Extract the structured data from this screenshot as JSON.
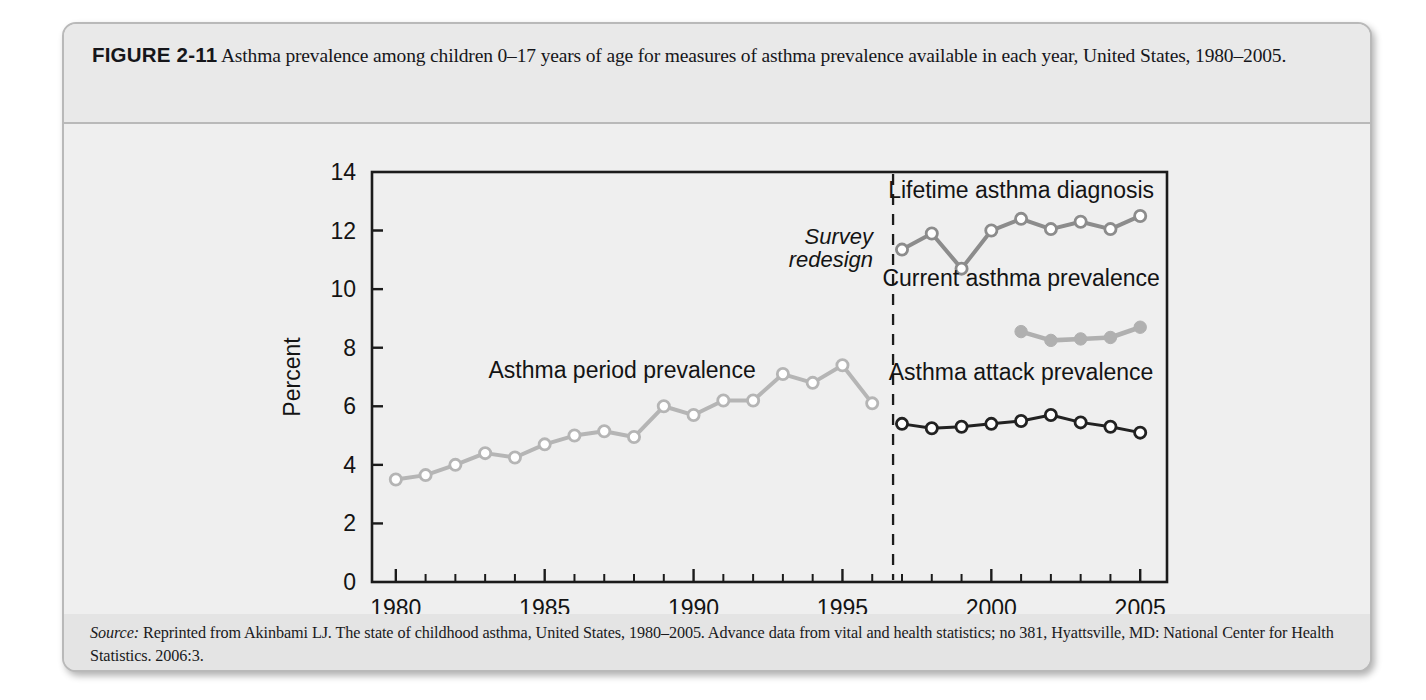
{
  "figure": {
    "label": "FIGURE 2-11",
    "caption": "Asthma prevalence among children 0–17 years of age for measures of asthma prevalence available in each year, United States, 1980–2005."
  },
  "source": {
    "word": "Source:",
    "text": " Reprinted from Akinbami LJ. The state of childhood asthma, United States, 1980–2005. Advance data from vital and health statistics; no 381, Hyattsville, MD: National Center for Health Statistics. 2006:3."
  },
  "annotations": {
    "survey_redesign_line1": "Survey",
    "survey_redesign_line2": "redesign",
    "redesign_year": 1996.7
  },
  "colors": {
    "period_prevalence": "#b5b5b5",
    "lifetime_diagnosis": "#8c8c8c",
    "current_prevalence": "#b0b0b0",
    "attack_prevalence": "#222222",
    "axis": "#1b1b1b",
    "card_bg": "#ececec",
    "plot_bg": "#efefef"
  },
  "chart_data": {
    "type": "line",
    "title": "",
    "xlabel": "",
    "ylabel": "Percent",
    "xlim": [
      1979.2,
      2005.9
    ],
    "ylim": [
      0,
      14
    ],
    "yticks": [
      0,
      2,
      4,
      6,
      8,
      10,
      12,
      14
    ],
    "ytick_labels": [
      "0",
      "2",
      "4",
      "6",
      "8",
      "10",
      "12",
      "14"
    ],
    "xticks_major": [
      1980,
      1985,
      1990,
      1995,
      2000,
      2005
    ],
    "xtick_labels": [
      "1980",
      "1985",
      "1990",
      "1995",
      "2000",
      "2005"
    ],
    "xticks_minor": [
      1981,
      1982,
      1983,
      1984,
      1986,
      1987,
      1988,
      1989,
      1991,
      1992,
      1993,
      1994,
      1996,
      1997,
      1998,
      1999,
      2001,
      2002,
      2003,
      2004
    ],
    "grid": false,
    "legend_position": "in-plot-annotations",
    "series": [
      {
        "name": "Asthma period prevalence",
        "marker": "open-circle",
        "color": "#b5b5b5",
        "label_x": 1987.6,
        "label_y": 6.95,
        "x": [
          1980,
          1981,
          1982,
          1983,
          1984,
          1985,
          1986,
          1987,
          1988,
          1989,
          1990,
          1991,
          1992,
          1993,
          1994,
          1995,
          1996
        ],
        "values": [
          3.5,
          3.65,
          4.0,
          4.4,
          4.25,
          4.7,
          5.0,
          5.15,
          4.95,
          6.0,
          5.7,
          6.2,
          6.2,
          7.1,
          6.8,
          7.4,
          6.1
        ]
      },
      {
        "name": "Lifetime asthma diagnosis",
        "marker": "open-circle",
        "color": "#8c8c8c",
        "label_x": 2001.0,
        "label_y": 13.1,
        "x": [
          1997,
          1998,
          1999,
          2000,
          2001,
          2002,
          2003,
          2004,
          2005
        ],
        "values": [
          11.35,
          11.9,
          10.7,
          12.0,
          12.4,
          12.05,
          12.3,
          12.05,
          12.5
        ]
      },
      {
        "name": "Current asthma prevalence",
        "marker": "filled-circle",
        "color": "#b0b0b0",
        "label_x": 2001.0,
        "label_y": 10.1,
        "x": [
          2001,
          2002,
          2003,
          2004,
          2005
        ],
        "values": [
          8.55,
          8.25,
          8.3,
          8.35,
          8.7
        ]
      },
      {
        "name": "Asthma attack prevalence",
        "marker": "open-circle",
        "color": "#222222",
        "label_x": 2001.0,
        "label_y": 6.9,
        "x": [
          1997,
          1998,
          1999,
          2000,
          2001,
          2002,
          2003,
          2004,
          2005
        ],
        "values": [
          5.4,
          5.25,
          5.3,
          5.4,
          5.5,
          5.7,
          5.45,
          5.3,
          5.1
        ]
      }
    ]
  }
}
